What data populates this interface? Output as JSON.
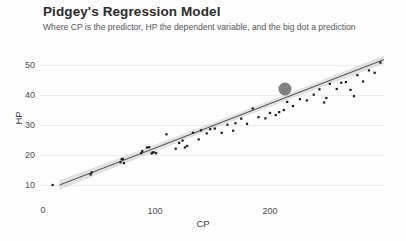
{
  "chart_data": {
    "type": "scatter",
    "title": "Pidgey's Regression Model",
    "subtitle": "Where CP is the predictor, HP the dependent variable, and the big dot a prediction",
    "xlabel": "CP",
    "ylabel": "HP",
    "xlim": [
      0,
      300
    ],
    "ylim": [
      5,
      55
    ],
    "xticks": [
      0,
      100,
      200
    ],
    "yticks": [
      10,
      20,
      30,
      40,
      50
    ],
    "zero_label": "0",
    "grid": true,
    "legend": "none",
    "colors": {
      "point": "#1a1a1a",
      "prediction_point": "#808080",
      "fit_line": "#4a4a4a",
      "confidence_band": "#c9c9c9",
      "gridline": "#ededed",
      "background": "#fefefe",
      "title_text": "#2b2b2b",
      "subtitle_text": "#555555"
    },
    "series": [
      {
        "name": "Pidgey observations",
        "role": "scatter",
        "points": [
          [
            11,
            10
          ],
          [
            44,
            13.5
          ],
          [
            45,
            14.2
          ],
          [
            70,
            17.6
          ],
          [
            71,
            18.6
          ],
          [
            72,
            18.7
          ],
          [
            73,
            17.3
          ],
          [
            88,
            20.6
          ],
          [
            89,
            21.3
          ],
          [
            93,
            22.5
          ],
          [
            95,
            22.6
          ],
          [
            97,
            20.5
          ],
          [
            98,
            20.8
          ],
          [
            99,
            20.9
          ],
          [
            101,
            20.6
          ],
          [
            110,
            26.9
          ],
          [
            118,
            22.1
          ],
          [
            121,
            24.0
          ],
          [
            124,
            24.8
          ],
          [
            126,
            22.5
          ],
          [
            128,
            23.0
          ],
          [
            133,
            27.4
          ],
          [
            138,
            25.2
          ],
          [
            140,
            28.2
          ],
          [
            145,
            27.2
          ],
          [
            148,
            28.6
          ],
          [
            152,
            28.8
          ],
          [
            158,
            27.4
          ],
          [
            163,
            30.1
          ],
          [
            168,
            28.1
          ],
          [
            170,
            30.6
          ],
          [
            175,
            32.1
          ],
          [
            180,
            30.4
          ],
          [
            185,
            35.5
          ],
          [
            190,
            32.6
          ],
          [
            196,
            32.2
          ],
          [
            200,
            34.0
          ],
          [
            205,
            33.3
          ],
          [
            208,
            34.3
          ],
          [
            212,
            35.0
          ],
          [
            215,
            37.7
          ],
          [
            220,
            36.3
          ],
          [
            226,
            38.6
          ],
          [
            232,
            38.2
          ],
          [
            238,
            40.1
          ],
          [
            243,
            41.9
          ],
          [
            247,
            37.5
          ],
          [
            249,
            39.0
          ],
          [
            252,
            43.7
          ],
          [
            258,
            42.0
          ],
          [
            262,
            44.1
          ],
          [
            266,
            44.3
          ],
          [
            270,
            41.7
          ],
          [
            273,
            39.6
          ],
          [
            276,
            46.6
          ],
          [
            281,
            44.5
          ],
          [
            286,
            48.2
          ],
          [
            291,
            47.4
          ],
          [
            296,
            50.8
          ]
        ]
      },
      {
        "name": "Prediction",
        "role": "prediction",
        "points": [
          [
            213,
            42.0
          ]
        ],
        "radius_px": 6.5
      },
      {
        "name": "Regression fit",
        "role": "line",
        "slope": 0.131,
        "intercept": 7.8,
        "x_start": 17,
        "x_end": 299,
        "y_start": 10.0,
        "y_end": 51.8,
        "band_halfwidth_left": 1.6,
        "band_halfwidth_mid": 0.55,
        "band_halfwidth_right": 1.4
      }
    ]
  }
}
